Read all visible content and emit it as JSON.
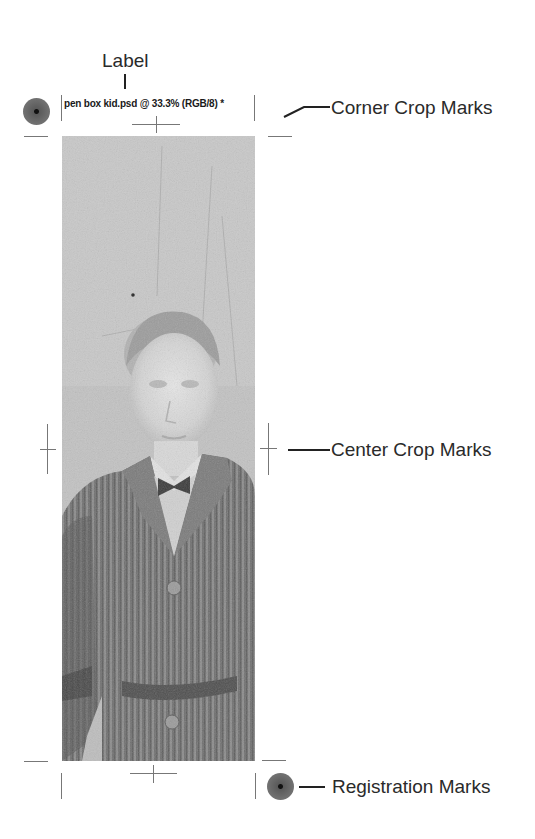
{
  "callouts": {
    "label": "Label",
    "corner_crop_marks": "Corner Crop Marks",
    "center_crop_marks": "Center Crop Marks",
    "registration_marks": "Registration Marks"
  },
  "document": {
    "label_text": "pen box kid.psd @ 33.3% (RGB/8) *"
  },
  "image": {
    "subject": "vintage photograph of a boy in a pinstriped jacket and bow tie",
    "tone": "grayscale"
  },
  "colors": {
    "background": "#ffffff",
    "marks": "#777777",
    "text": "#2a2a2a"
  }
}
